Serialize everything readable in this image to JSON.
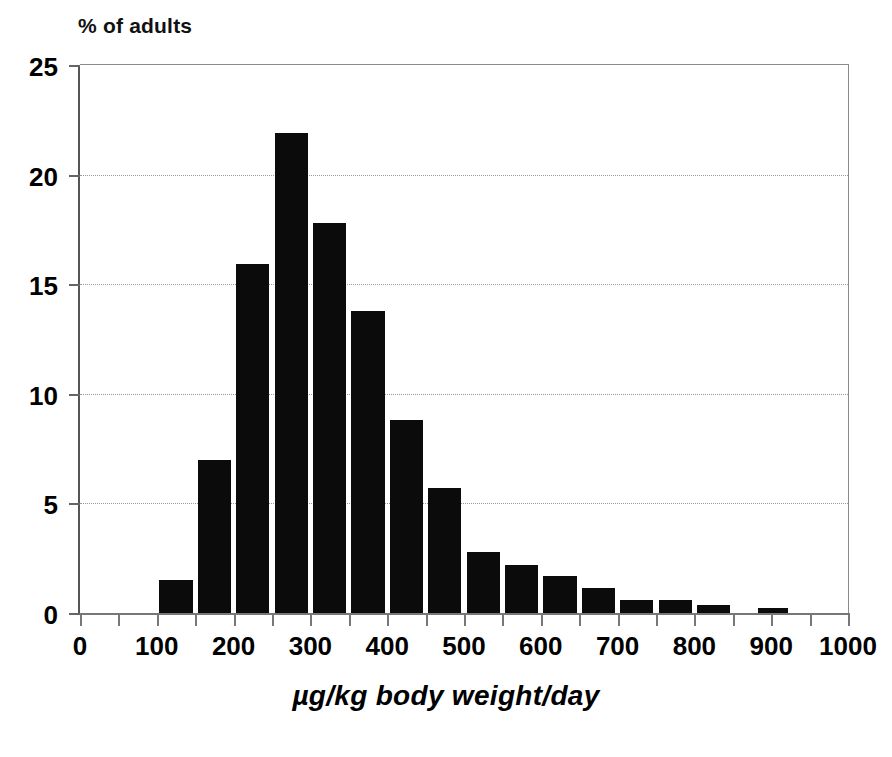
{
  "chart_data": {
    "type": "bar",
    "title": "",
    "subtitle": "",
    "ylabel": "% of adults",
    "xlabel": "µg/kg body weight/day",
    "grid": true,
    "legend": "none",
    "xlim": [
      0,
      1000
    ],
    "ylim": [
      0,
      25
    ],
    "bin_width": 50,
    "y_ticks": [
      {
        "value": 0,
        "label": "0"
      },
      {
        "value": 5,
        "label": "5"
      },
      {
        "value": 10,
        "label": "10"
      },
      {
        "value": 15,
        "label": "15"
      },
      {
        "value": 20,
        "label": "20"
      },
      {
        "value": 25,
        "label": "25"
      }
    ],
    "x_ticks": [
      {
        "value": 0,
        "label": "0"
      },
      {
        "value": 50,
        "label": ""
      },
      {
        "value": 100,
        "label": "100"
      },
      {
        "value": 150,
        "label": ""
      },
      {
        "value": 200,
        "label": "200"
      },
      {
        "value": 250,
        "label": ""
      },
      {
        "value": 300,
        "label": "300"
      },
      {
        "value": 350,
        "label": ""
      },
      {
        "value": 400,
        "label": "400"
      },
      {
        "value": 450,
        "label": ""
      },
      {
        "value": 500,
        "label": "500"
      },
      {
        "value": 550,
        "label": ""
      },
      {
        "value": 600,
        "label": "600"
      },
      {
        "value": 650,
        "label": ""
      },
      {
        "value": 700,
        "label": "700"
      },
      {
        "value": 750,
        "label": ""
      },
      {
        "value": 800,
        "label": "800"
      },
      {
        "value": 850,
        "label": ""
      },
      {
        "value": 900,
        "label": "900"
      },
      {
        "value": 950,
        "label": ""
      },
      {
        "value": 1000,
        "label": "1000"
      }
    ],
    "gridlines": [
      5,
      10,
      15,
      20
    ],
    "bar_color": "#0b0b0b",
    "bins": [
      {
        "x0": 0,
        "x1": 50,
        "value": 0.0
      },
      {
        "x0": 50,
        "x1": 100,
        "value": 0.0
      },
      {
        "x0": 100,
        "x1": 150,
        "value": 1.5
      },
      {
        "x0": 150,
        "x1": 200,
        "value": 7.0
      },
      {
        "x0": 200,
        "x1": 250,
        "value": 15.9
      },
      {
        "x0": 250,
        "x1": 300,
        "value": 21.9
      },
      {
        "x0": 300,
        "x1": 350,
        "value": 17.8
      },
      {
        "x0": 350,
        "x1": 400,
        "value": 13.8
      },
      {
        "x0": 400,
        "x1": 450,
        "value": 8.8
      },
      {
        "x0": 450,
        "x1": 500,
        "value": 5.7
      },
      {
        "x0": 500,
        "x1": 550,
        "value": 2.8
      },
      {
        "x0": 550,
        "x1": 600,
        "value": 2.2
      },
      {
        "x0": 600,
        "x1": 650,
        "value": 1.7
      },
      {
        "x0": 650,
        "x1": 700,
        "value": 1.15
      },
      {
        "x0": 700,
        "x1": 750,
        "value": 0.6
      },
      {
        "x0": 750,
        "x1": 800,
        "value": 0.6
      },
      {
        "x0": 800,
        "x1": 850,
        "value": 0.35
      },
      {
        "x0": 850,
        "x1": 900,
        "value": 0.0
      },
      {
        "x0": 880,
        "x1": 925,
        "value": 0.25
      },
      {
        "x0": 925,
        "x1": 1000,
        "value": 0.0
      }
    ],
    "categories": [
      "100-150",
      "150-200",
      "200-250",
      "250-300",
      "300-350",
      "350-400",
      "400-450",
      "450-500",
      "500-550",
      "550-600",
      "600-650",
      "650-700",
      "700-750",
      "750-800",
      "800-850",
      "880-925"
    ],
    "values": [
      1.5,
      7.0,
      15.9,
      21.9,
      17.8,
      13.8,
      8.8,
      5.7,
      2.8,
      2.2,
      1.7,
      1.15,
      0.6,
      0.6,
      0.35,
      0.25
    ]
  }
}
